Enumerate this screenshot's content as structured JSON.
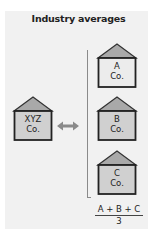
{
  "title": "Industry averages",
  "companies": {
    "xyz": {
      "line1": "XYZ",
      "line2": "Co."
    },
    "a": {
      "line1": "A",
      "line2": "Co."
    },
    "b": {
      "line1": "B",
      "line2": "Co."
    },
    "c": {
      "line1": "C",
      "line2": "Co."
    }
  },
  "formula": {
    "numerator": "A + B + C",
    "denominator": "3"
  },
  "icons": {
    "building": "building-icon",
    "compare": "double-arrow-icon"
  },
  "colors": {
    "panel": "#f1f1f1",
    "roof": "#a9a9a9",
    "body_gray": "#d0d0d0",
    "body_light": "#ececec",
    "outline": "#333333"
  }
}
